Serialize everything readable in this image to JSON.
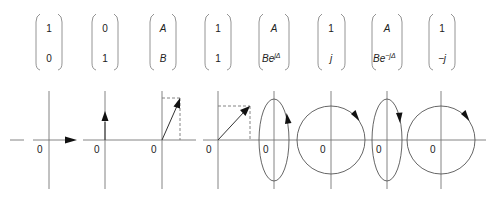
{
  "figure": {
    "origin_label": "0",
    "columns": [
      {
        "id": "horizontal-linear",
        "top": "1",
        "bottom": "0",
        "bottom_sup": "",
        "state": "horizontal linear polarization"
      },
      {
        "id": "vertical-linear",
        "top": "0",
        "bottom": "1",
        "bottom_sup": "",
        "state": "vertical linear polarization"
      },
      {
        "id": "general-linear",
        "top": "A",
        "bottom": "B",
        "bottom_sup": "",
        "state": "linear polarization at angle"
      },
      {
        "id": "diagonal-linear",
        "top": "1",
        "bottom": "1",
        "bottom_sup": "",
        "state": "linear polarization at 45 degrees"
      },
      {
        "id": "elliptical-ccw",
        "top": "A",
        "bottom": "Be",
        "bottom_sup": "jΔ",
        "state": "elliptical polarization, counterclockwise"
      },
      {
        "id": "circular-cw",
        "top": "1",
        "bottom": "j",
        "bottom_sup": "",
        "state": "circular polarization, clockwise"
      },
      {
        "id": "elliptical-cw",
        "top": "A",
        "bottom": "Be",
        "bottom_sup": "−jΔ",
        "state": "elliptical polarization, clockwise"
      },
      {
        "id": "circular-ccw",
        "top": "1",
        "bottom": "−j",
        "bottom_sup": "",
        "state": "circular polarization"
      }
    ]
  }
}
